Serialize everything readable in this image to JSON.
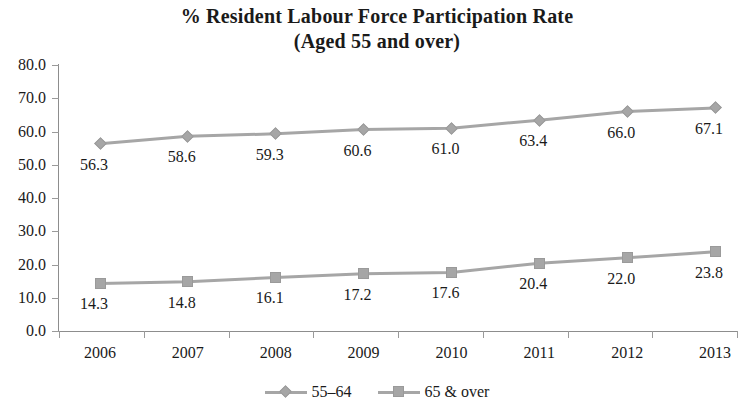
{
  "chart_data": {
    "type": "line",
    "title": "% Resident Labour Force Participation Rate",
    "subtitle": "(Aged 55 and over)",
    "xlabel": "",
    "ylabel": "",
    "ylim": [
      0.0,
      80.0
    ],
    "ytick_step": 10.0,
    "grid": false,
    "legend_position": "bottom",
    "categories": [
      "2006",
      "2007",
      "2008",
      "2009",
      "2010",
      "2011",
      "2012",
      "2013"
    ],
    "ytick_labels": [
      "80.0",
      "70.0",
      "60.0",
      "50.0",
      "40.0",
      "30.0",
      "20.0",
      "10.0",
      "0.0"
    ],
    "ytick_values": [
      80.0,
      70.0,
      60.0,
      50.0,
      40.0,
      30.0,
      20.0,
      10.0,
      0.0
    ],
    "series": [
      {
        "name": "55–64",
        "marker": "diamond",
        "color": "#a6a6a6",
        "values": [
          56.3,
          58.6,
          59.3,
          60.6,
          61.0,
          63.4,
          66.0,
          67.1
        ],
        "labels": [
          "56.3",
          "58.6",
          "59.3",
          "60.6",
          "61.0",
          "63.4",
          "66.0",
          "67.1"
        ]
      },
      {
        "name": "65 & over",
        "marker": "square",
        "color": "#a6a6a6",
        "values": [
          14.3,
          14.8,
          16.1,
          17.2,
          17.6,
          20.4,
          22.0,
          23.8
        ],
        "labels": [
          "14.3",
          "14.8",
          "16.1",
          "17.2",
          "17.6",
          "20.4",
          "22.0",
          "23.8"
        ]
      }
    ]
  }
}
